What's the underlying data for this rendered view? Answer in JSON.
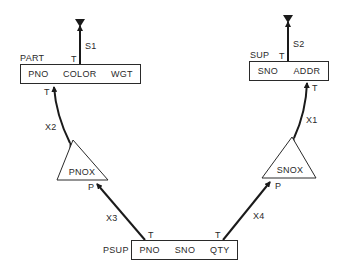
{
  "diagram": {
    "colors": {
      "line": "#1a1a1a",
      "text": "#2a2a2a",
      "background": "#ffffff"
    },
    "records": [
      {
        "name": "PART",
        "fields": [
          "PNO",
          "COLOR",
          "WGT"
        ]
      },
      {
        "name": "SUP",
        "fields": [
          "SNO",
          "ADDR"
        ]
      },
      {
        "name": "PSUP",
        "fields": [
          "PNO",
          "SNO",
          "QTY"
        ]
      }
    ],
    "indexes": [
      {
        "name": "PNOX"
      },
      {
        "name": "SNOX"
      }
    ],
    "links": [
      {
        "name": "S1",
        "end_label": "T"
      },
      {
        "name": "S2",
        "end_label": "T"
      },
      {
        "name": "X1",
        "from_label": "T",
        "to_label": ""
      },
      {
        "name": "X2",
        "from_label": "T",
        "to_label": ""
      },
      {
        "name": "X3",
        "from_label": "T",
        "to_label": "P"
      },
      {
        "name": "X4",
        "from_label": "T",
        "to_label": "P"
      }
    ]
  }
}
